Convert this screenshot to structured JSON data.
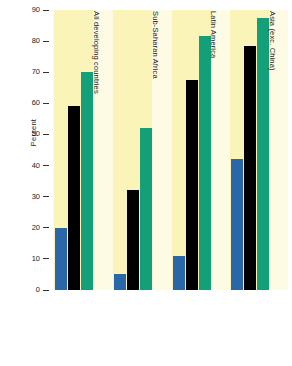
{
  "chart_data": {
    "type": "bar",
    "title": "",
    "subtitle": "",
    "xlabel": "",
    "ylabel": "Percent",
    "ylim": [
      0,
      90
    ],
    "yticks": [
      0,
      10,
      20,
      30,
      40,
      50,
      60,
      70,
      80,
      90
    ],
    "ytick_labels": [
      "0",
      "10",
      "20",
      "30",
      "40",
      "50",
      "60",
      "70",
      "80",
      "90"
    ],
    "grid": false,
    "legend_position": "bottom",
    "categories": [
      "All developing countries",
      "Sub-Saharan Africa",
      "Latin America",
      "Asia (exc. China)"
    ],
    "series": [
      {
        "name": "1970",
        "color": "#2a67a8",
        "values": [
          20,
          5,
          11,
          42
        ]
      },
      {
        "name": "1983",
        "color": "#000000",
        "values": [
          59,
          32,
          67.5,
          78.5
        ]
      },
      {
        "name": "1990–91",
        "color": "#13a078",
        "values": [
          70,
          52,
          81.5,
          87.5
        ]
      }
    ],
    "annotations": []
  },
  "legend": {
    "left_label": "1970",
    "right_label": "1990–91",
    "middle_label": "1983",
    "swatches": [
      {
        "name": "swatch-1970",
        "color": "#2a67a8"
      },
      {
        "name": "swatch-1983",
        "color": "#000000"
      },
      {
        "name": "swatch-1990-91",
        "color": "#13a078"
      }
    ]
  },
  "colors": {
    "band_tint": "#faf4b8",
    "band_plain": "#fdfbe3",
    "series_1970": "#2a67a8",
    "series_1983": "#000000",
    "series_1990_91": "#13a078",
    "axis": "#333333",
    "background": "#ffffff"
  },
  "axis": {
    "y_title": "Percent"
  }
}
